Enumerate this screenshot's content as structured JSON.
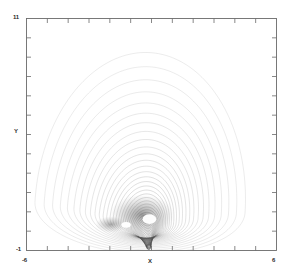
{
  "figure": {
    "background": "#ffffff",
    "frame_color": "#6a6a6a",
    "trace_color": "#555555"
  },
  "chart_data": {
    "type": "scatter",
    "title": "",
    "subtitle": "",
    "xlabel": "X",
    "ylabel": "Y",
    "xlim": [
      -6,
      6
    ],
    "ylim": [
      -1,
      11
    ],
    "grid": false,
    "legend": null,
    "x_tick_labels": [
      "-6",
      "6"
    ],
    "y_tick_labels": [
      "-1",
      "11"
    ],
    "x_major_ticks": [
      -6,
      -5,
      -4,
      -3,
      -2,
      -1,
      0,
      1,
      2,
      3,
      4,
      5,
      6
    ],
    "y_major_ticks": [
      -1,
      0,
      1,
      2,
      3,
      4,
      5,
      6,
      7,
      8,
      9,
      10,
      11
    ],
    "series": [
      {
        "name": "trajectory",
        "kind": "orbit-family",
        "center": [
          -0.55,
          1.25
        ],
        "n_loops": 46,
        "outer_radius_x": 5.05,
        "outer_radius_y": 8.0,
        "contraction_ratio": 0.915,
        "drift_per_loop": [
          0.012,
          -0.055
        ]
      }
    ],
    "voids": [
      {
        "name": "void-large",
        "center": [
          -0.1,
          0.62
        ],
        "rx": 0.33,
        "ry": 0.25
      },
      {
        "name": "void-small",
        "center": [
          -1.22,
          0.33
        ],
        "rx": 0.23,
        "ry": 0.15
      }
    ],
    "annotations": []
  },
  "labels": {
    "y_max": "11",
    "y_min": "-1",
    "x_min": "-6",
    "x_max": "6",
    "x_axis": "X",
    "y_axis": "Y"
  }
}
